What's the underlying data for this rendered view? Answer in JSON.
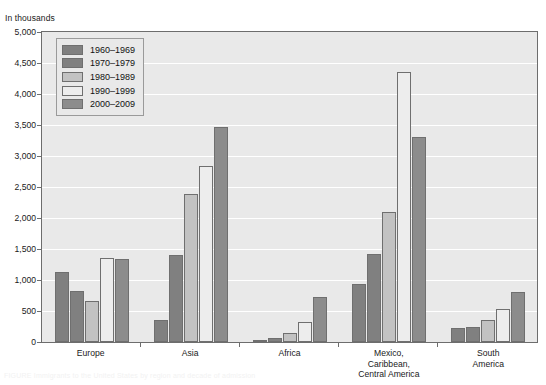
{
  "axis": {
    "unit_label": "In thousands",
    "y_ticks": [
      "5,000",
      "4,500",
      "4,000",
      "3,500",
      "3,000",
      "2,500",
      "2,000",
      "1,500",
      "1,000",
      "500",
      "0"
    ]
  },
  "legend": {
    "items": [
      {
        "label": "1960–1969",
        "color": "#808080",
        "name": "legend-1960-1969"
      },
      {
        "label": "1970–1979",
        "color": "#808080",
        "name": "legend-1970-1979"
      },
      {
        "label": "1980–1989",
        "color": "#c2c2c2",
        "name": "legend-1980-1989"
      },
      {
        "label": "1990–1999",
        "color": "#ededed",
        "name": "legend-1990-1999"
      },
      {
        "label": "2000–2009",
        "color": "#8c8c8c",
        "name": "legend-2000-2009"
      }
    ]
  },
  "caption": {
    "text": "FIGURE  Immigrants to the United States by region and decade of admission"
  },
  "chart_data": {
    "type": "bar",
    "title": "",
    "subtitle": "",
    "xlabel": "",
    "ylabel": "In thousands",
    "ylim": [
      0,
      5000
    ],
    "ytick_step": 500,
    "grid": true,
    "legend_position": "top-left-inside",
    "categories": [
      "Europe",
      "Asia",
      "Africa",
      "Mexico,\nCaribbean,\nCentral America",
      "South\nAmerica"
    ],
    "category_labels": [
      [
        "Europe"
      ],
      [
        "Asia"
      ],
      [
        "Africa"
      ],
      [
        "Mexico,",
        "Caribbean,",
        "Central America"
      ],
      [
        "South",
        "America"
      ]
    ],
    "series": [
      {
        "name": "1960–1969",
        "color": "#808080",
        "values": [
          1130,
          350,
          20,
          940,
          220
        ]
      },
      {
        "name": "1970–1979",
        "color": "#808080",
        "values": [
          820,
          1400,
          70,
          1420,
          240
        ]
      },
      {
        "name": "1980–1989",
        "color": "#c2c2c2",
        "values": [
          660,
          2380,
          140,
          2100,
          360
        ]
      },
      {
        "name": "1990–1999",
        "color": "#ededed",
        "values": [
          1350,
          2840,
          320,
          4350,
          540
        ]
      },
      {
        "name": "2000–2009",
        "color": "#8c8c8c",
        "values": [
          1340,
          3470,
          730,
          3310,
          810
        ]
      }
    ]
  }
}
